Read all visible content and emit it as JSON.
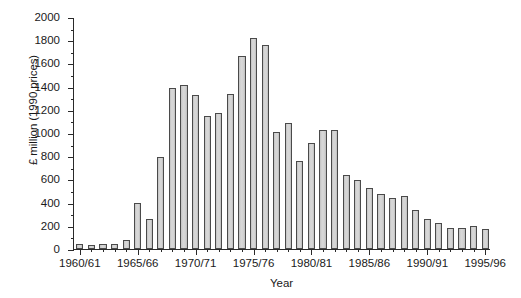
{
  "chart_data": {
    "type": "bar",
    "title": "",
    "xlabel": "Year",
    "ylabel": "£ million (1990 prices)",
    "ylim": [
      0,
      2000
    ],
    "ytick_step": 200,
    "yminor_step": 100,
    "grid": false,
    "legend": null,
    "ytick_labels": [
      "0",
      "200",
      "400",
      "600",
      "800",
      "1000",
      "1200",
      "1400",
      "1600",
      "1800",
      "2000"
    ],
    "xtick_labels": [
      "1960/61",
      "1965/66",
      "1970/71",
      "1975/76",
      "1980/81",
      "1985/86",
      "1990/91",
      "1995/96"
    ],
    "xtick_categories": [
      "1960/61",
      "1965/66",
      "1970/71",
      "1975/76",
      "1980/81",
      "1985/86",
      "1990/91",
      "1995/96"
    ],
    "bar_color": "#d0d0d0",
    "bar_edge_color": "#4a4a4a",
    "categories": [
      "1960/61",
      "1961/62",
      "1962/63",
      "1963/64",
      "1964/65",
      "1965/66",
      "1966/67",
      "1967/68",
      "1968/69",
      "1969/70",
      "1970/71",
      "1971/72",
      "1972/73",
      "1973/74",
      "1974/75",
      "1975/76",
      "1976/77",
      "1977/78",
      "1978/79",
      "1979/80",
      "1980/81",
      "1981/82",
      "1982/83",
      "1983/84",
      "1984/85",
      "1985/86",
      "1986/87",
      "1987/88",
      "1988/89",
      "1989/90",
      "1990/91",
      "1991/92",
      "1992/93",
      "1993/94",
      "1994/95",
      "1995/96"
    ],
    "values": [
      40,
      35,
      40,
      40,
      75,
      395,
      255,
      790,
      1385,
      1410,
      1325,
      1150,
      1170,
      1340,
      1665,
      1820,
      1755,
      1010,
      1090,
      755,
      910,
      1030,
      1030,
      640,
      595,
      530,
      475,
      440,
      455,
      340,
      255,
      225,
      180,
      185,
      195,
      175
    ]
  }
}
